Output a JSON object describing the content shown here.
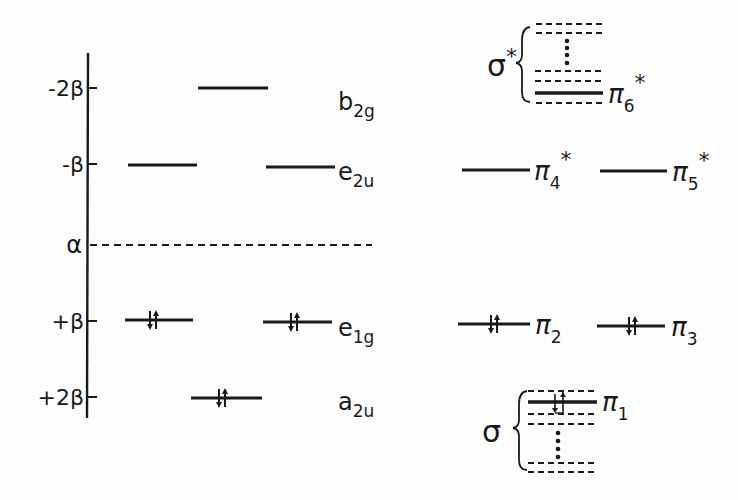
{
  "diagram": {
    "type": "molecular-orbital-energy-level-diagram",
    "axis": {
      "ticks": [
        {
          "label": "-2β",
          "y": 88
        },
        {
          "label": "-β",
          "y": 164
        },
        {
          "label": "α",
          "y": 245
        },
        {
          "label": "+β",
          "y": 321
        },
        {
          "label": "+2β",
          "y": 397
        }
      ]
    },
    "huckel_levels": [
      {
        "symmetry": "b2g",
        "base": "b",
        "sub": "2g",
        "energy": "-2β",
        "degeneracy": 1,
        "electrons": 0
      },
      {
        "symmetry": "e2u",
        "base": "e",
        "sub": "2u",
        "energy": "-β",
        "degeneracy": 2,
        "electrons": 0
      },
      {
        "symmetry": "e1g",
        "base": "e",
        "sub": "1g",
        "energy": "+β",
        "degeneracy": 2,
        "electrons": 4
      },
      {
        "symmetry": "a2u",
        "base": "a",
        "sub": "2u",
        "energy": "+2β",
        "degeneracy": 1,
        "electrons": 2
      }
    ],
    "nonbonding_reference": {
      "label": "α",
      "style": "dashed"
    },
    "pi_orbitals": [
      {
        "label": "π",
        "sub": "6",
        "star": true
      },
      {
        "label": "π",
        "sub": "4",
        "star": true
      },
      {
        "label": "π",
        "sub": "5",
        "star": true
      },
      {
        "label": "π",
        "sub": "2",
        "star": false
      },
      {
        "label": "π",
        "sub": "3",
        "star": false
      },
      {
        "label": "π",
        "sub": "1",
        "star": false
      }
    ],
    "sigma_manifolds": [
      {
        "label": "σ",
        "star": true,
        "position": "top"
      },
      {
        "label": "σ",
        "star": false,
        "position": "bottom"
      }
    ]
  }
}
